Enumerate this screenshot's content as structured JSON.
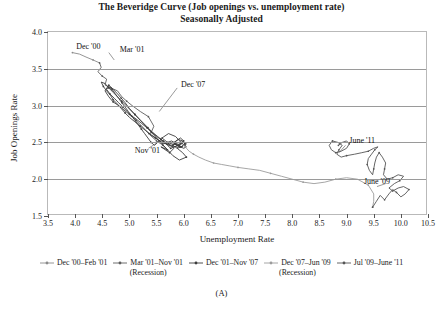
{
  "title": {
    "line1": "The Beveridge Curve (Job openings vs. unemployment rate)",
    "line2": "Seasonally Adjusted"
  },
  "caption": "(A)",
  "axes": {
    "xlabel": "Unemployment Rate",
    "ylabel": "Job Openings Rate",
    "xticks": [
      "3.5",
      "4.0",
      "4.5",
      "5.0",
      "5.5",
      "6.0",
      "6.5",
      "7.0",
      "7.5",
      "8.0",
      "8.5",
      "9.0",
      "9.5",
      "10.0",
      "10.5"
    ],
    "yticks": [
      "1.5",
      "2.0",
      "2.5",
      "3.0",
      "3.5",
      "4.0"
    ],
    "xlim": [
      3.5,
      10.5
    ],
    "ylim": [
      1.5,
      4.0
    ]
  },
  "annotations": [
    {
      "text": "Dec '00",
      "x": 4.02,
      "y": 3.8
    },
    {
      "text": "Mar '01",
      "x": 4.82,
      "y": 3.76
    },
    {
      "text": "Dec '07",
      "x": 5.95,
      "y": 3.28
    },
    {
      "text": "Nov '01",
      "x": 5.1,
      "y": 2.38
    },
    {
      "text": "June '11",
      "x": 9.05,
      "y": 2.52
    },
    {
      "text": "June '09",
      "x": 9.32,
      "y": 1.96
    }
  ],
  "legend": [
    {
      "label": "Dec '00–Feb '01",
      "sub": "",
      "color": "#8a8a8a"
    },
    {
      "label": "Mar '01–Nov '01",
      "sub": "(Recession)",
      "color": "#5e5e5e"
    },
    {
      "label": "Dec '01–Nov '07",
      "sub": "",
      "color": "#3c3c3c"
    },
    {
      "label": "Dec '07–Jun '09",
      "sub": "(Recession)",
      "color": "#9c9c9c"
    },
    {
      "label": "Jul '09–June '11",
      "sub": "",
      "color": "#555555"
    }
  ],
  "chart_data": {
    "type": "line",
    "title": "The Beveridge Curve (Job openings vs. unemployment rate) Seasonally Adjusted",
    "xlabel": "Unemployment Rate",
    "ylabel": "Job Openings Rate",
    "xlim": [
      3.5,
      10.5
    ],
    "ylim": [
      1.5,
      4.0
    ],
    "grid": "horizontal",
    "legend_position": "bottom",
    "series": [
      {
        "name": "Dec '00-Feb '01",
        "color": "#8a8a8a",
        "points": [
          [
            3.95,
            3.72
          ],
          [
            4.08,
            3.7
          ],
          [
            4.2,
            3.66
          ],
          [
            4.33,
            3.62
          ],
          [
            4.45,
            3.58
          ]
        ]
      },
      {
        "name": "Mar '01-Nov '01 (Recession)",
        "color": "#5e5e5e",
        "points": [
          [
            4.45,
            3.58
          ],
          [
            4.48,
            3.52
          ],
          [
            4.42,
            3.46
          ],
          [
            4.5,
            3.4
          ],
          [
            4.58,
            3.36
          ],
          [
            4.55,
            3.28
          ],
          [
            4.66,
            3.24
          ],
          [
            4.78,
            3.2
          ],
          [
            4.86,
            3.12
          ],
          [
            4.95,
            3.06
          ],
          [
            5.05,
            3.0
          ],
          [
            5.2,
            2.92
          ],
          [
            5.35,
            2.85
          ],
          [
            5.45,
            2.72
          ],
          [
            5.38,
            2.6
          ],
          [
            5.5,
            2.52
          ],
          [
            5.62,
            2.46
          ]
        ]
      },
      {
        "name": "Dec '01-Nov '07",
        "color": "#3c3c3c",
        "points": [
          [
            5.62,
            2.46
          ],
          [
            5.7,
            2.4
          ],
          [
            5.58,
            2.44
          ],
          [
            5.74,
            2.36
          ],
          [
            5.82,
            2.42
          ],
          [
            5.7,
            2.5
          ],
          [
            5.6,
            2.56
          ],
          [
            5.72,
            2.62
          ],
          [
            5.85,
            2.58
          ],
          [
            5.95,
            2.5
          ],
          [
            5.88,
            2.42
          ],
          [
            5.98,
            2.36
          ],
          [
            6.05,
            2.3
          ],
          [
            5.92,
            2.26
          ],
          [
            5.8,
            2.32
          ],
          [
            5.7,
            2.4
          ],
          [
            5.6,
            2.48
          ],
          [
            5.5,
            2.56
          ],
          [
            5.4,
            2.64
          ],
          [
            5.3,
            2.72
          ],
          [
            5.2,
            2.8
          ],
          [
            5.1,
            2.88
          ],
          [
            5.0,
            2.96
          ],
          [
            4.92,
            3.04
          ],
          [
            4.85,
            3.1
          ],
          [
            4.78,
            3.16
          ],
          [
            4.7,
            3.22
          ],
          [
            4.62,
            3.28
          ],
          [
            4.55,
            3.2
          ],
          [
            4.62,
            3.12
          ],
          [
            4.7,
            3.05
          ],
          [
            4.8,
            3.0
          ],
          [
            4.9,
            2.94
          ],
          [
            5.0,
            2.88
          ],
          [
            5.12,
            2.82
          ],
          [
            5.22,
            2.76
          ],
          [
            5.32,
            2.7
          ],
          [
            5.42,
            2.64
          ],
          [
            5.52,
            2.58
          ],
          [
            5.62,
            2.52
          ],
          [
            5.72,
            2.46
          ],
          [
            5.82,
            2.44
          ],
          [
            5.92,
            2.46
          ],
          [
            6.0,
            2.5
          ],
          [
            6.05,
            2.48
          ],
          [
            5.95,
            2.44
          ],
          [
            5.85,
            2.48
          ],
          [
            5.78,
            2.52
          ],
          [
            5.7,
            2.5
          ],
          [
            5.62,
            2.48
          ],
          [
            5.55,
            2.52
          ],
          [
            5.48,
            2.56
          ],
          [
            5.4,
            2.6
          ],
          [
            5.3,
            2.66
          ],
          [
            5.2,
            2.72
          ],
          [
            5.1,
            2.78
          ],
          [
            5.0,
            2.84
          ],
          [
            4.92,
            2.9
          ],
          [
            4.85,
            2.96
          ],
          [
            4.78,
            3.02
          ],
          [
            4.7,
            3.08
          ],
          [
            4.65,
            3.14
          ],
          [
            4.58,
            3.2
          ],
          [
            4.52,
            3.26
          ],
          [
            4.48,
            3.32
          ],
          [
            4.55,
            3.3
          ],
          [
            4.62,
            3.24
          ],
          [
            4.7,
            3.18
          ],
          [
            4.78,
            3.12
          ],
          [
            4.86,
            3.06
          ],
          [
            4.94,
            3.0
          ],
          [
            5.02,
            2.94
          ],
          [
            5.1,
            2.88
          ],
          [
            5.18,
            2.82
          ],
          [
            5.26,
            2.76
          ],
          [
            5.34,
            2.7
          ],
          [
            5.42,
            2.64
          ],
          [
            5.5,
            2.58
          ],
          [
            5.58,
            2.54
          ],
          [
            5.66,
            2.5
          ],
          [
            5.74,
            2.48
          ],
          [
            5.82,
            2.5
          ],
          [
            5.9,
            2.54
          ],
          [
            5.98,
            2.52
          ],
          [
            6.02,
            2.48
          ],
          [
            5.96,
            2.44
          ],
          [
            5.88,
            2.42
          ],
          [
            5.8,
            2.46
          ],
          [
            5.86,
            2.52
          ],
          [
            5.94,
            2.56
          ],
          [
            6.0,
            2.52
          ],
          [
            5.92,
            2.48
          ],
          [
            5.84,
            2.44
          ],
          [
            5.76,
            2.42
          ],
          [
            5.7,
            2.46
          ],
          [
            5.64,
            2.5
          ],
          [
            5.58,
            2.54
          ],
          [
            5.52,
            2.5
          ],
          [
            5.46,
            2.46
          ],
          [
            5.4,
            2.5
          ],
          [
            5.34,
            2.56
          ],
          [
            5.28,
            2.62
          ],
          [
            5.22,
            2.68
          ],
          [
            5.16,
            2.74
          ],
          [
            5.1,
            2.8
          ],
          [
            5.04,
            2.86
          ],
          [
            4.98,
            2.92
          ],
          [
            4.92,
            2.98
          ],
          [
            4.86,
            3.04
          ],
          [
            4.8,
            3.1
          ],
          [
            4.74,
            3.16
          ],
          [
            4.68,
            3.22
          ],
          [
            4.62,
            3.26
          ],
          [
            4.58,
            3.22
          ],
          [
            4.64,
            3.16
          ],
          [
            4.72,
            3.1
          ],
          [
            4.8,
            3.04
          ],
          [
            4.88,
            2.98
          ],
          [
            4.96,
            2.92
          ],
          [
            5.04,
            2.86
          ],
          [
            5.12,
            2.8
          ],
          [
            5.2,
            2.74
          ],
          [
            5.28,
            2.68
          ],
          [
            5.36,
            2.62
          ],
          [
            5.44,
            2.58
          ],
          [
            5.52,
            2.54
          ],
          [
            5.6,
            2.5
          ],
          [
            5.68,
            2.48
          ],
          [
            5.76,
            2.46
          ],
          [
            5.84,
            2.48
          ],
          [
            5.92,
            2.5
          ],
          [
            5.98,
            2.48
          ],
          [
            6.02,
            2.46
          ],
          [
            6.05,
            2.44
          ],
          [
            6.0,
            2.42
          ],
          [
            5.94,
            2.44
          ],
          [
            5.88,
            2.46
          ],
          [
            5.82,
            2.48
          ],
          [
            5.9,
            2.46
          ],
          [
            5.96,
            2.44
          ],
          [
            6.0,
            2.46
          ]
        ]
      },
      {
        "name": "Dec '07-Jun '09 (Recession)",
        "color": "#9c9c9c",
        "points": [
          [
            6.0,
            2.46
          ],
          [
            6.05,
            2.42
          ],
          [
            6.1,
            2.38
          ],
          [
            6.18,
            2.34
          ],
          [
            6.28,
            2.3
          ],
          [
            6.4,
            2.26
          ],
          [
            6.55,
            2.22
          ],
          [
            6.7,
            2.2
          ],
          [
            6.85,
            2.18
          ],
          [
            7.0,
            2.16
          ],
          [
            7.2,
            2.14
          ],
          [
            7.4,
            2.12
          ],
          [
            7.6,
            2.08
          ],
          [
            7.8,
            2.04
          ],
          [
            8.0,
            2.0
          ],
          [
            8.2,
            1.96
          ],
          [
            8.4,
            1.94
          ],
          [
            8.6,
            1.96
          ],
          [
            8.8,
            2.0
          ],
          [
            9.0,
            2.02
          ],
          [
            9.2,
            2.0
          ],
          [
            9.4,
            1.92
          ],
          [
            9.5,
            1.8
          ],
          [
            9.5,
            1.7
          ],
          [
            9.48,
            1.62
          ]
        ]
      },
      {
        "name": "Jul '09-June '11",
        "color": "#555555",
        "points": [
          [
            9.48,
            1.62
          ],
          [
            9.55,
            1.7
          ],
          [
            9.62,
            1.78
          ],
          [
            9.7,
            1.72
          ],
          [
            9.78,
            1.8
          ],
          [
            9.85,
            1.86
          ],
          [
            9.92,
            1.82
          ],
          [
            10.0,
            1.76
          ],
          [
            10.08,
            1.8
          ],
          [
            10.15,
            1.86
          ],
          [
            10.05,
            1.9
          ],
          [
            9.95,
            1.88
          ],
          [
            9.85,
            1.84
          ],
          [
            9.78,
            1.88
          ],
          [
            9.88,
            1.94
          ],
          [
            9.98,
            1.98
          ],
          [
            10.05,
            2.04
          ],
          [
            9.95,
            2.06
          ],
          [
            9.85,
            2.02
          ],
          [
            9.75,
            2.0
          ],
          [
            9.68,
            2.06
          ],
          [
            9.7,
            2.14
          ],
          [
            9.72,
            2.22
          ],
          [
            9.66,
            2.3
          ],
          [
            9.6,
            2.36
          ],
          [
            9.55,
            2.3
          ],
          [
            9.52,
            2.22
          ],
          [
            9.5,
            2.14
          ],
          [
            9.48,
            2.06
          ],
          [
            9.42,
            2.12
          ],
          [
            9.38,
            2.2
          ],
          [
            9.4,
            2.28
          ],
          [
            9.46,
            2.34
          ],
          [
            9.52,
            2.4
          ],
          [
            9.58,
            2.44
          ],
          [
            9.5,
            2.42
          ],
          [
            9.4,
            2.38
          ],
          [
            9.28,
            2.36
          ],
          [
            9.15,
            2.34
          ],
          [
            9.0,
            2.32
          ],
          [
            8.9,
            2.3
          ],
          [
            8.82,
            2.34
          ],
          [
            8.86,
            2.4
          ],
          [
            8.92,
            2.46
          ],
          [
            8.84,
            2.5
          ],
          [
            8.74,
            2.52
          ],
          [
            8.68,
            2.46
          ],
          [
            8.72,
            2.4
          ],
          [
            8.8,
            2.36
          ],
          [
            8.9,
            2.38
          ],
          [
            9.0,
            2.42
          ],
          [
            9.05,
            2.48
          ],
          [
            9.0,
            2.52
          ],
          [
            8.92,
            2.5
          ],
          [
            8.85,
            2.46
          ]
        ]
      }
    ]
  }
}
